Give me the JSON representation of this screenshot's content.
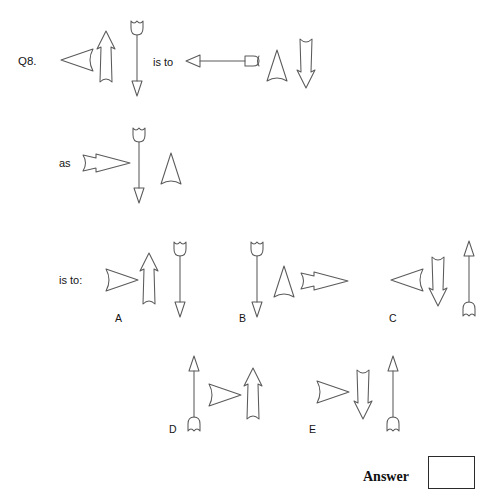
{
  "question": {
    "label": "Q8.",
    "connector_is_to": "is to",
    "connector_as": "as",
    "connector_is_to_colon": "is to:"
  },
  "answer": {
    "label": "Answer",
    "value": ""
  },
  "options": [
    {
      "letter": "A"
    },
    {
      "letter": "B"
    },
    {
      "letter": "C"
    },
    {
      "letter": "D"
    },
    {
      "letter": "E"
    }
  ],
  "figures": {
    "stem_first": [
      {
        "shape": "left-arrowhead-short",
        "name": "left-arrowhead-short-icon"
      },
      {
        "shape": "up-arrowhead-tall",
        "name": "up-arrowhead-tall-icon"
      },
      {
        "shape": "full-arrow-down-long",
        "name": "full-arrow-down-long-icon"
      }
    ],
    "stem_second": [
      {
        "shape": "left-arrow-horizontal-nocked",
        "name": "left-arrow-horizontal-nocked-icon"
      },
      {
        "shape": "up-arrowhead-short",
        "name": "up-arrowhead-short-icon"
      },
      {
        "shape": "down-arrowhead-tall",
        "name": "down-arrowhead-tall-icon"
      }
    ],
    "stem_third": [
      {
        "shape": "right-arrowhead-long",
        "name": "right-arrowhead-long-icon"
      },
      {
        "shape": "full-arrow-down-long",
        "name": "full-arrow-down-long-icon"
      },
      {
        "shape": "up-arrowhead-short",
        "name": "up-arrowhead-short-icon"
      }
    ],
    "option_a": [
      {
        "shape": "right-arrowhead-short",
        "name": "right-arrowhead-short-icon"
      },
      {
        "shape": "up-arrowhead-tall",
        "name": "up-arrowhead-tall-icon"
      },
      {
        "shape": "full-arrow-down-long",
        "name": "full-arrow-down-long-icon"
      }
    ],
    "option_b": [
      {
        "shape": "full-arrow-down-long",
        "name": "full-arrow-down-long-icon"
      },
      {
        "shape": "up-arrowhead-short",
        "name": "up-arrowhead-short-icon"
      },
      {
        "shape": "right-arrowhead-long",
        "name": "right-arrowhead-long-icon"
      }
    ],
    "option_c": [
      {
        "shape": "left-arrowhead-short",
        "name": "left-arrowhead-short-icon"
      },
      {
        "shape": "down-arrowhead-tall",
        "name": "down-arrowhead-tall-icon"
      },
      {
        "shape": "full-arrow-up-long",
        "name": "full-arrow-up-long-icon"
      }
    ],
    "option_d": [
      {
        "shape": "full-arrow-up-long",
        "name": "full-arrow-up-long-icon"
      },
      {
        "shape": "right-arrowhead-short",
        "name": "right-arrowhead-short-icon"
      },
      {
        "shape": "up-arrowhead-tall",
        "name": "up-arrowhead-tall-icon"
      }
    ],
    "option_e": [
      {
        "shape": "right-arrowhead-short",
        "name": "right-arrowhead-short-icon"
      },
      {
        "shape": "down-arrowhead-tall",
        "name": "down-arrowhead-tall-icon"
      },
      {
        "shape": "full-arrow-up-long",
        "name": "full-arrow-up-long-icon"
      }
    ]
  },
  "colors": {
    "stroke": "#5a5a5a",
    "text": "#141414",
    "box_border": "#2b2b2b",
    "background": "#ffffff"
  }
}
